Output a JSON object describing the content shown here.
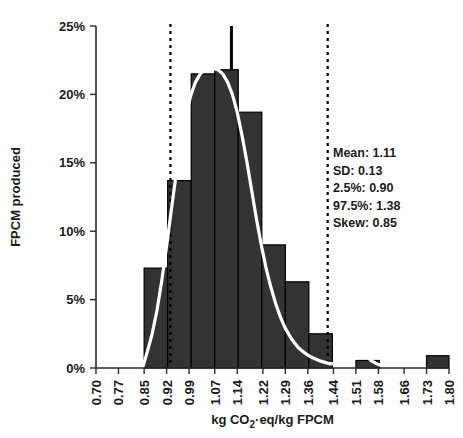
{
  "chart_data": {
    "type": "bar",
    "title": "",
    "subtitle": "",
    "xlabel": "kg CO₂·eq/kg FPCM",
    "ylabel": "FPCM produced",
    "xlim": [
      0.7,
      1.8
    ],
    "ylim": [
      0,
      25
    ],
    "grid": false,
    "legend": "none",
    "x_tick_labels": [
      "0.70",
      "0.77",
      "0.85",
      "0.92",
      "0.99",
      "1.07",
      "1.14",
      "1.22",
      "1.29",
      "1.36",
      "1.44",
      "1.51",
      "1.58",
      "1.66",
      "1.73",
      "1.80"
    ],
    "x_tick_values": [
      0.7,
      0.77,
      0.85,
      0.92,
      0.99,
      1.07,
      1.14,
      1.22,
      1.29,
      1.36,
      1.44,
      1.51,
      1.58,
      1.66,
      1.73,
      1.8
    ],
    "y_tick_labels": [
      "0%",
      "5%",
      "10%",
      "15%",
      "20%",
      "25%"
    ],
    "y_tick_values": [
      0,
      5,
      10,
      15,
      20,
      25
    ],
    "bin_width": 0.0733,
    "categories": [
      "0.85–0.92",
      "0.92–0.99",
      "0.99–1.07",
      "1.07–1.14",
      "1.14–1.22",
      "1.22–1.29",
      "1.29–1.36",
      "1.36–1.44",
      "1.44–1.51",
      "1.51–1.58",
      "1.58–1.66",
      "1.66–1.73",
      "1.73–1.80"
    ],
    "bins": [
      {
        "x0": 0.85,
        "x1": 0.9233,
        "value": 7.3
      },
      {
        "x0": 0.9233,
        "x1": 0.9967,
        "value": 13.7
      },
      {
        "x0": 0.9967,
        "x1": 1.07,
        "value": 21.5
      },
      {
        "x0": 1.07,
        "x1": 1.1433,
        "value": 21.8
      },
      {
        "x0": 1.1433,
        "x1": 1.2167,
        "value": 18.7
      },
      {
        "x0": 1.2167,
        "x1": 1.29,
        "value": 9.0
      },
      {
        "x0": 1.29,
        "x1": 1.3633,
        "value": 6.3
      },
      {
        "x0": 1.3633,
        "x1": 1.4367,
        "value": 2.5
      },
      {
        "x0": 1.4367,
        "x1": 1.51,
        "value": 0.0
      },
      {
        "x0": 1.51,
        "x1": 1.5833,
        "value": 0.55
      },
      {
        "x0": 1.5833,
        "x1": 1.6567,
        "value": 0.0
      },
      {
        "x0": 1.6567,
        "x1": 1.73,
        "value": 0.0
      },
      {
        "x0": 1.73,
        "x1": 1.8,
        "value": 0.9
      }
    ],
    "values": [
      7.3,
      13.7,
      21.5,
      21.8,
      18.7,
      9.0,
      6.3,
      2.5,
      0.0,
      0.55,
      0.0,
      0.0,
      0.9
    ],
    "density_curve": {
      "label": "kernel-density-curve",
      "color": "#ffffff",
      "points": [
        [
          0.845,
          0.0
        ],
        [
          0.86,
          1.2
        ],
        [
          0.875,
          2.5
        ],
        [
          0.89,
          4.2
        ],
        [
          0.905,
          6.4
        ],
        [
          0.92,
          8.9
        ],
        [
          0.935,
          11.6
        ],
        [
          0.95,
          14.2
        ],
        [
          0.965,
          16.5
        ],
        [
          0.98,
          18.4
        ],
        [
          0.995,
          19.9
        ],
        [
          1.01,
          20.9
        ],
        [
          1.025,
          21.5
        ],
        [
          1.04,
          21.8
        ],
        [
          1.06,
          21.9
        ],
        [
          1.08,
          21.8
        ],
        [
          1.095,
          21.5
        ],
        [
          1.11,
          20.9
        ],
        [
          1.125,
          20.0
        ],
        [
          1.14,
          18.7
        ],
        [
          1.155,
          17.0
        ],
        [
          1.17,
          15.1
        ],
        [
          1.185,
          13.0
        ],
        [
          1.2,
          10.9
        ],
        [
          1.215,
          9.0
        ],
        [
          1.23,
          7.3
        ],
        [
          1.245,
          5.9
        ],
        [
          1.26,
          4.7
        ],
        [
          1.275,
          3.7
        ],
        [
          1.29,
          2.9
        ],
        [
          1.31,
          2.1
        ],
        [
          1.33,
          1.5
        ],
        [
          1.35,
          1.1
        ],
        [
          1.37,
          0.8
        ],
        [
          1.4,
          0.5
        ],
        [
          1.43,
          0.3
        ],
        [
          1.46,
          0.4
        ],
        [
          1.48,
          0.7
        ],
        [
          1.5,
          1.1
        ],
        [
          1.515,
          1.5
        ],
        [
          1.53,
          1.2
        ],
        [
          1.545,
          0.8
        ],
        [
          1.56,
          0.5
        ],
        [
          1.58,
          0.25
        ],
        [
          1.6,
          0.1
        ],
        [
          1.64,
          0.05
        ],
        [
          1.7,
          0.02
        ]
      ]
    },
    "reference_lines": [
      {
        "name": "lower-percentile-line",
        "x": 0.932,
        "style": "dashed",
        "color": "#000000"
      },
      {
        "name": "upper-percentile-line",
        "x": 1.422,
        "style": "dashed",
        "color": "#000000"
      }
    ],
    "mean_marker": {
      "name": "mean-spike",
      "x": 1.122,
      "top": 25.0,
      "bottom": 21.8,
      "color": "#000000"
    },
    "annotations": {
      "stats": [
        "Mean: 1.11",
        "SD: 0.13",
        "2.5%: 0.90",
        "97.5%: 1.38",
        "Skew: 0.85"
      ]
    },
    "colors": {
      "bar_fill": "#333333",
      "bar_stroke": "#000000",
      "axis": "#2b2b2b",
      "text": "#1a1a1a",
      "curve": "#ffffff",
      "background": "#ffffff"
    }
  }
}
